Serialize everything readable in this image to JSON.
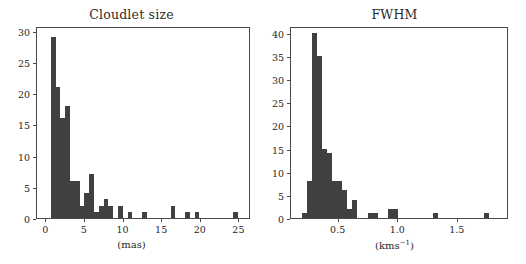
{
  "figure": {
    "background": "#ffffff",
    "bar_color": "#404040",
    "axis_color": "#4a4a4a",
    "text_color": "#262626"
  },
  "chart_data": [
    {
      "type": "bar",
      "title": "Cloudlet size",
      "xlabel": "(mas)",
      "ylabel": "",
      "xlim": [
        -1.2,
        26.5
      ],
      "ylim": [
        0,
        30.8
      ],
      "xticks": [
        0,
        5,
        10,
        15,
        20,
        25
      ],
      "xtick_labels": [
        "0",
        "5",
        "10",
        "15",
        "20",
        "25"
      ],
      "yticks": [
        0,
        5,
        10,
        15,
        20,
        25,
        30
      ],
      "ytick_labels": [
        "0",
        "5",
        "10",
        "15",
        "20",
        "25",
        "30"
      ],
      "grid": false,
      "legend": "none",
      "bin_width": 0.62,
      "bin_starts": [
        0.6,
        1.22,
        1.84,
        2.46,
        3.08,
        3.7,
        4.32,
        4.94,
        5.56,
        6.18,
        6.8,
        7.42,
        8.04,
        8.66,
        9.28,
        9.9,
        10.52,
        11.14,
        11.76,
        12.38,
        13.0,
        13.62,
        14.24,
        14.86,
        15.48,
        16.1,
        16.72,
        17.34,
        17.96,
        18.58,
        19.2,
        19.82,
        20.44,
        21.06,
        21.68,
        22.3,
        22.92,
        23.54,
        24.16,
        24.78
      ],
      "values": [
        29,
        21,
        16,
        18,
        6,
        6,
        2,
        4,
        7,
        1,
        2,
        3,
        2,
        0,
        2,
        0,
        1,
        0,
        0,
        1,
        0,
        0,
        0,
        0,
        0,
        2,
        0,
        0,
        1,
        0,
        1,
        0,
        0,
        0,
        0,
        0,
        0,
        0,
        1,
        0
      ]
    },
    {
      "type": "bar",
      "title": "FWHM",
      "xlabel": "(kms-1)",
      "xlabel_base": "(kms",
      "xlabel_sup": "−1",
      "xlabel_tail": ")",
      "ylabel": "",
      "xlim": [
        0.1,
        1.93
      ],
      "ylim": [
        0,
        41.5
      ],
      "xticks": [
        0.5,
        1.0,
        1.5
      ],
      "xtick_labels": [
        "0.5",
        "1.0",
        "1.5"
      ],
      "yticks": [
        0,
        5,
        10,
        15,
        20,
        25,
        30,
        35,
        40
      ],
      "ytick_labels": [
        "0",
        "5",
        "10",
        "15",
        "20",
        "25",
        "30",
        "35",
        "40"
      ],
      "grid": false,
      "legend": "none",
      "bin_width": 0.0425,
      "bin_starts": [
        0.19,
        0.2325,
        0.275,
        0.3175,
        0.36,
        0.4025,
        0.445,
        0.4875,
        0.53,
        0.5725,
        0.615,
        0.6575,
        0.7,
        0.7425,
        0.785,
        0.8275,
        0.87,
        0.9125,
        0.955,
        0.9975,
        1.04,
        1.0825,
        1.125,
        1.1675,
        1.21,
        1.2525,
        1.295,
        1.3375,
        1.38,
        1.4225,
        1.465,
        1.5075,
        1.55,
        1.5925,
        1.635,
        1.6775,
        1.72,
        1.7625,
        1.805,
        1.8475
      ],
      "values": [
        1,
        8,
        40,
        35,
        15,
        14,
        8,
        8,
        6,
        2,
        4,
        0,
        0,
        1,
        1,
        0,
        0,
        2,
        2,
        0,
        0,
        0,
        0,
        0,
        0,
        0,
        1,
        0,
        0,
        0,
        0,
        0,
        0,
        0,
        0,
        0,
        1,
        0,
        0,
        0
      ]
    }
  ]
}
